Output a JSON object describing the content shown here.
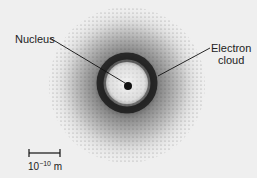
{
  "diagram": {
    "labels": {
      "nucleus": "Nucleus",
      "electron_cloud_line1": "Electron",
      "electron_cloud_line2": "cloud"
    },
    "scale_bar": {
      "base": "10",
      "exponent": "−10",
      "unit": "m"
    },
    "colors": {
      "background": "#efefef",
      "ink": "#111111"
    }
  }
}
